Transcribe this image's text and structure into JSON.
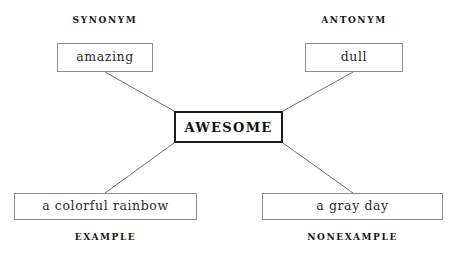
{
  "diagram": {
    "type": "word-map",
    "center": {
      "label": "AWESOME"
    },
    "quadrants": [
      {
        "key": "synonym",
        "heading": "SYNONYM",
        "value": "amazing",
        "position": "top-left"
      },
      {
        "key": "antonym",
        "heading": "ANTONYM",
        "value": "dull",
        "position": "top-right"
      },
      {
        "key": "example",
        "heading": "EXAMPLE",
        "value": "a colorful rainbow",
        "position": "bottom-left"
      },
      {
        "key": "nonexample",
        "heading": "NONEXAMPLE",
        "value": "a gray day",
        "position": "bottom-right"
      }
    ],
    "colors": {
      "background": "#ffffff",
      "box_border": "#8c8c8c",
      "center_border": "#1c1c1c",
      "connector": "#6f6f6f",
      "text": "#1a1a1a"
    },
    "connectors": [
      {
        "from": "synonym",
        "to": "center",
        "x1": 105,
        "y1": 72,
        "x2": 174,
        "y2": 111
      },
      {
        "from": "antonym",
        "to": "center",
        "x1": 353,
        "y1": 72,
        "x2": 283,
        "y2": 111
      },
      {
        "from": "example",
        "to": "center",
        "x1": 105,
        "y1": 193,
        "x2": 174,
        "y2": 143
      },
      {
        "from": "nonexample",
        "to": "center",
        "x1": 353,
        "y1": 193,
        "x2": 283,
        "y2": 143
      }
    ]
  }
}
